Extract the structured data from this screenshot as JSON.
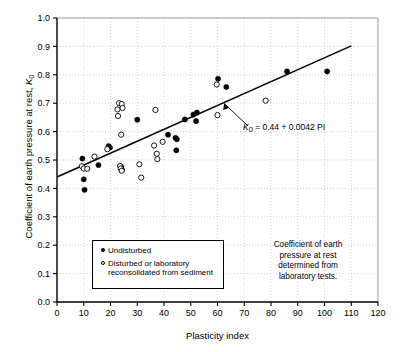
{
  "chart_data": {
    "type": "scatter",
    "title": "",
    "xlabel": "Plasticity index",
    "ylabel": "Coefficient of earth pressure at rest, K0",
    "xlim": [
      0,
      120
    ],
    "ylim": [
      0.0,
      1.0
    ],
    "xticks": [
      "0",
      "10",
      "20",
      "30",
      "40",
      "50",
      "60",
      "70",
      "80",
      "90",
      "100",
      "110",
      "120"
    ],
    "yticks": [
      "0.0",
      "0.1",
      "0.2",
      "0.3",
      "0.4",
      "0.5",
      "0.6",
      "0.7",
      "0.8",
      "0.9",
      "1.0"
    ],
    "grid": "both-dotted",
    "legend_position": "inside-lower-left",
    "series": [
      {
        "name": "Undisturbed",
        "marker": "filled-circle",
        "points": [
          [
            9.5,
            0.505
          ],
          [
            10.0,
            0.432
          ],
          [
            10.3,
            0.395
          ],
          [
            15.5,
            0.482
          ],
          [
            19.3,
            0.549
          ],
          [
            19.8,
            0.544
          ],
          [
            24.0,
            0.476
          ],
          [
            24.3,
            0.466
          ],
          [
            30.0,
            0.642
          ],
          [
            41.5,
            0.589
          ],
          [
            44.3,
            0.578
          ],
          [
            44.8,
            0.573
          ],
          [
            44.6,
            0.534
          ],
          [
            47.8,
            0.643
          ],
          [
            51.0,
            0.66
          ],
          [
            52.3,
            0.667
          ],
          [
            52.0,
            0.637
          ],
          [
            60.2,
            0.786
          ],
          [
            63.3,
            0.757
          ],
          [
            86.0,
            0.812
          ],
          [
            101.0,
            0.812
          ]
        ]
      },
      {
        "name": "Disturbed or laboratory reconsolidated from sediment",
        "marker": "open-circle",
        "points": [
          [
            9.3,
            0.478
          ],
          [
            10.0,
            0.47
          ],
          [
            11.3,
            0.469
          ],
          [
            14.0,
            0.512
          ],
          [
            18.8,
            0.538
          ],
          [
            22.6,
            0.678
          ],
          [
            22.8,
            0.655
          ],
          [
            23.2,
            0.7
          ],
          [
            24.2,
            0.697
          ],
          [
            24.5,
            0.683
          ],
          [
            24.0,
            0.589
          ],
          [
            23.6,
            0.479
          ],
          [
            23.8,
            0.47
          ],
          [
            24.2,
            0.462
          ],
          [
            30.8,
            0.485
          ],
          [
            31.5,
            0.438
          ],
          [
            36.8,
            0.676
          ],
          [
            36.3,
            0.551
          ],
          [
            37.3,
            0.522
          ],
          [
            37.5,
            0.503
          ],
          [
            39.5,
            0.564
          ],
          [
            59.7,
            0.766
          ],
          [
            60.0,
            0.658
          ],
          [
            78.0,
            0.709
          ]
        ]
      }
    ],
    "trendline": {
      "label": "K0 = 0.44 + 0.0042 PI",
      "intercept": 0.44,
      "slope": 0.0042,
      "x_start": 0,
      "x_end": 110
    },
    "annotations": [
      {
        "name": "equation-label",
        "prefix": "K",
        "subscript": "0",
        "expression": " = 0.44 + 0.0042 PI"
      },
      {
        "name": "note-text",
        "lines": [
          "Coefficient of earth",
          "pressure at rest",
          "determined from",
          "laboratory tests."
        ]
      }
    ]
  },
  "axes": {
    "y_title_prefix": "Coefficient of earth pressure at rest, ",
    "y_title_symbol": "K",
    "y_title_sub": "0",
    "x_title": "Plasticity index"
  },
  "legend": {
    "items": [
      {
        "marker": "filled-circle",
        "label": "Undisturbed"
      },
      {
        "marker": "open-circle",
        "label_line1": "Disturbed or laboratory",
        "label_line2": "reconsolidated from sediment"
      }
    ]
  },
  "colors": {
    "axis": "#000000",
    "grid": "#c8c8c8",
    "marker": "#000000",
    "background": "#ffffff"
  }
}
